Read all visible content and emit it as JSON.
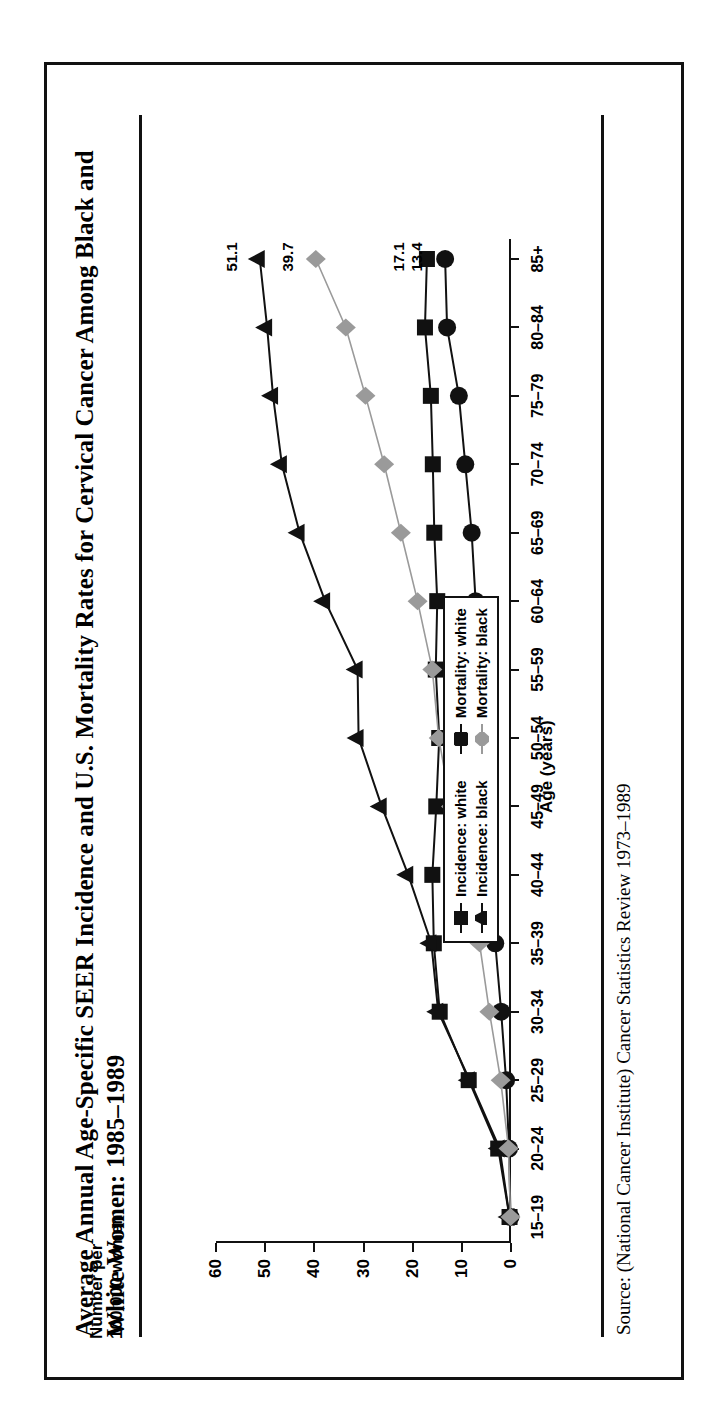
{
  "title": "Average Annual Age-Specific SEER Incidence and U.S. Mortality Rates for Cervical Cancer Among Black and White Women: 1985–1989",
  "source": "Source: (National Cancer Institute) Cancer Statistics Review 1973–1989",
  "ylabel_line1": "Number per",
  "ylabel_line2": "100,000 women",
  "chart_data": {
    "type": "line",
    "title": "Average Annual Age-Specific SEER Incidence and U.S. Mortality Rates for Cervical Cancer Among Black and White Women: 1985–1989",
    "xlabel": "Age (years)",
    "ylabel": "Number per 100,000 women",
    "ylim": [
      0,
      60
    ],
    "yticks": [
      0,
      10,
      20,
      30,
      40,
      50,
      60
    ],
    "grid": false,
    "legend_position": "inside-lower-right",
    "categories": [
      "15–19",
      "20–24",
      "25–29",
      "30–34",
      "35–39",
      "40–44",
      "45–49",
      "50–54",
      "55–59",
      "60–64",
      "65–69",
      "70–74",
      "75–79",
      "80–84",
      "85+"
    ],
    "series": [
      {
        "name": "Incidence: white",
        "marker": "square",
        "color": "#111111",
        "values": [
          0.3,
          2.6,
          8.6,
          14.5,
          15.7,
          16.0,
          15.2,
          14.6,
          15.3,
          15.0,
          15.6,
          15.9,
          16.3,
          17.5,
          17.1
        ],
        "end_label": "17.1"
      },
      {
        "name": "Incidence: black",
        "marker": "triangle",
        "color": "#111111",
        "values": [
          0.3,
          2.3,
          8.4,
          14.8,
          16.2,
          20.9,
          26.3,
          31.0,
          31.2,
          37.8,
          43.0,
          46.6,
          48.4,
          49.6,
          51.1
        ],
        "end_label": "51.1"
      },
      {
        "name": "Mortality: white",
        "marker": "circle",
        "color": "#111111",
        "values": [
          0.1,
          0.4,
          1.0,
          2.0,
          3.2,
          4.3,
          5.2,
          6.0,
          6.6,
          7.2,
          8.0,
          9.3,
          10.6,
          13.0,
          13.4
        ],
        "end_label": "13.4"
      },
      {
        "name": "Mortality: black",
        "marker": "diamond",
        "color": "#9a9a9a",
        "values": [
          0.1,
          0.5,
          2.1,
          4.4,
          6.4,
          9.2,
          12.2,
          14.7,
          16.0,
          19.0,
          22.4,
          25.8,
          29.6,
          33.6,
          39.7
        ],
        "end_label": "39.7"
      }
    ]
  }
}
